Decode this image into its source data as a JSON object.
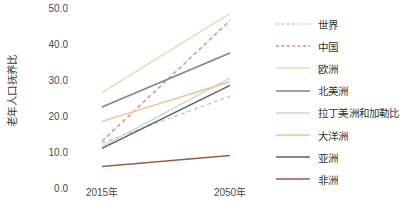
{
  "chart_data": {
    "type": "line",
    "title": "",
    "subtitle": "",
    "xlabel": "",
    "ylabel": "老年人口抚养比",
    "x": [
      "2015年",
      "2050年"
    ],
    "categories": [
      "2015年",
      "2050年"
    ],
    "ylim": [
      0.0,
      50.0
    ],
    "xlim": [
      0,
      1
    ],
    "yticks": [
      "0.0",
      "10.0",
      "20.0",
      "30.0",
      "40.0",
      "50.0"
    ],
    "ytick_values": [
      0.0,
      10.0,
      20.0,
      30.0,
      40.0,
      50.0
    ],
    "grid": false,
    "legend_position": "right",
    "series": [
      {
        "name": "世界",
        "values": [
          12.5,
          25.5
        ],
        "color": "#c8c8c8",
        "style": "dashed"
      },
      {
        "name": "中国",
        "values": [
          13.0,
          46.5
        ],
        "color": "#d98b84",
        "style": "dashed"
      },
      {
        "name": "欧洲",
        "values": [
          26.5,
          48.5
        ],
        "color": "#dfe0b0",
        "style": "solid"
      },
      {
        "name": "北美洲",
        "values": [
          22.5,
          37.5
        ],
        "color": "#8d7c8e",
        "style": "solid"
      },
      {
        "name": "拉丁美洲和加勒比",
        "values": [
          11.5,
          30.5
        ],
        "color": "#c6d7dd",
        "style": "solid"
      },
      {
        "name": "大洋洲",
        "values": [
          18.5,
          29.5
        ],
        "color": "#eec08a",
        "style": "solid"
      },
      {
        "name": "亚洲",
        "values": [
          11.0,
          28.5
        ],
        "color": "#5a6068",
        "style": "solid"
      },
      {
        "name": "非洲",
        "values": [
          6.0,
          9.0
        ],
        "color": "#9a5a44",
        "style": "solid"
      }
    ]
  },
  "axes": {
    "y_title": "老年人口抚养比",
    "y_tick_labels": [
      "50.0",
      "40.0",
      "30.0",
      "20.0",
      "10.0",
      "0.0"
    ],
    "x_tick_labels": [
      "2015年",
      "2050年"
    ]
  },
  "legend": {
    "items": [
      {
        "label": "世界",
        "color": "#c8c8c8",
        "style": "dashed"
      },
      {
        "label": "中国",
        "color": "#d98b84",
        "style": "dashed"
      },
      {
        "label": "欧洲",
        "color": "#dfe0b0",
        "style": "solid"
      },
      {
        "label": "北美洲",
        "color": "#8d7c8e",
        "style": "solid"
      },
      {
        "label": "拉丁美洲和加勒比",
        "color": "#c6d7dd",
        "style": "solid"
      },
      {
        "label": "大洋洲",
        "color": "#eec08a",
        "style": "solid"
      },
      {
        "label": "亚洲",
        "color": "#5a6068",
        "style": "solid"
      },
      {
        "label": "非洲",
        "color": "#9a5a44",
        "style": "solid"
      }
    ]
  }
}
